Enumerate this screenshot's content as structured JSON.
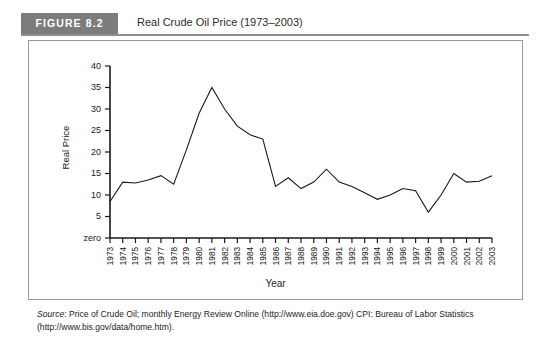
{
  "figure": {
    "badge_label": "FIGURE 8.2",
    "title": "Real Crude Oil Price (1973–2003)"
  },
  "source": {
    "label": "Source",
    "text": ": Price of Crude Oil; monthly Energy Review Online (http://www.eia.doe.gov) CPI: Bureau of Labor Statistics (http://www.bis.gov/data/home.htm)."
  },
  "chart_data": {
    "type": "line",
    "title": "Real Crude Oil Price (1973–2003)",
    "xlabel": "Year",
    "ylabel": "Real Price",
    "grid": false,
    "legend": "none",
    "ylim": [
      0,
      40
    ],
    "ytick_labels": [
      "zero",
      "5",
      "10",
      "15",
      "20",
      "25",
      "30",
      "35",
      "40"
    ],
    "ytick_values": [
      0,
      5,
      10,
      15,
      20,
      25,
      30,
      35,
      40
    ],
    "zero_label": "zero",
    "categories": [
      "1973",
      "1974",
      "1975",
      "1976",
      "1977",
      "1978",
      "1979",
      "1980",
      "1981",
      "1982",
      "1983",
      "1984",
      "1985",
      "1986",
      "1987",
      "1988",
      "1989",
      "1990",
      "1991",
      "1992",
      "1993",
      "1994",
      "1995",
      "1996",
      "1997",
      "1998",
      "1999",
      "2000",
      "2001",
      "2002",
      "2003"
    ],
    "values": [
      8.5,
      13.0,
      12.8,
      13.5,
      14.5,
      12.5,
      20.5,
      29.0,
      35.0,
      30.0,
      26.0,
      24.0,
      23.0,
      12.0,
      14.0,
      11.5,
      13.0,
      16.0,
      13.0,
      12.0,
      10.5,
      9.0,
      10.0,
      11.5,
      11.0,
      6.0,
      10.0,
      15.0,
      13.0,
      13.2,
      14.5
    ],
    "series": [
      {
        "name": "Real Price",
        "values": [
          8.5,
          13.0,
          12.8,
          13.5,
          14.5,
          12.5,
          20.5,
          29.0,
          35.0,
          30.0,
          26.0,
          24.0,
          23.0,
          12.0,
          14.0,
          11.5,
          13.0,
          16.0,
          13.0,
          12.0,
          10.5,
          9.0,
          10.0,
          11.5,
          11.0,
          6.0,
          10.0,
          15.0,
          13.0,
          13.2,
          14.5
        ],
        "color": "#1a1a1a"
      }
    ]
  }
}
